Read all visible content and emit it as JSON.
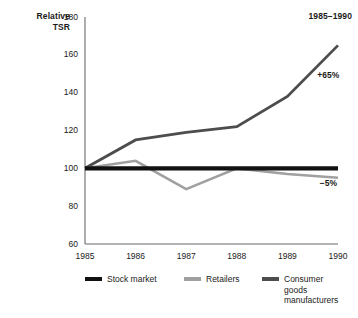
{
  "chart_data": {
    "type": "line",
    "title": "1985–1990",
    "ylabel": "Relative\nTSR",
    "xlabel": "",
    "x": [
      1985,
      1986,
      1987,
      1988,
      1989,
      1990
    ],
    "categories": [
      "1985",
      "1986",
      "1987",
      "1988",
      "1989",
      "1990"
    ],
    "ylim": [
      60,
      180
    ],
    "yticks": [
      60,
      80,
      100,
      120,
      140,
      160,
      180
    ],
    "ytick_labels": [
      "60",
      "80",
      "100",
      "120",
      "140",
      "160",
      "180"
    ],
    "grid": false,
    "legend_position": "bottom",
    "series": [
      {
        "name": "Stock market",
        "color": "#111111",
        "width": 4.2,
        "values": [
          100,
          100,
          100,
          100,
          100,
          100
        ]
      },
      {
        "name": "Retailers",
        "color": "#a0a0a0",
        "width": 2.6,
        "values": [
          100,
          104,
          89,
          100,
          97,
          95
        ]
      },
      {
        "name": "Consumer goods manufacturers",
        "color": "#4d4d4d",
        "width": 2.8,
        "values": [
          100,
          115,
          119,
          122,
          138,
          165
        ]
      }
    ],
    "annotations": [
      {
        "text": "+65%",
        "x": 1989.55,
        "y": 149,
        "series": "Consumer goods manufacturers"
      },
      {
        "text": "−5%",
        "x": 1989.6,
        "y": 92,
        "series": "Retailers"
      }
    ]
  },
  "legend": {
    "items": [
      {
        "label": "Stock market",
        "color": "#111111"
      },
      {
        "label": "Retailers",
        "color": "#a0a0a0"
      },
      {
        "label": "Consumer\ngoods\nmanufacturers",
        "color": "#4d4d4d"
      }
    ]
  }
}
